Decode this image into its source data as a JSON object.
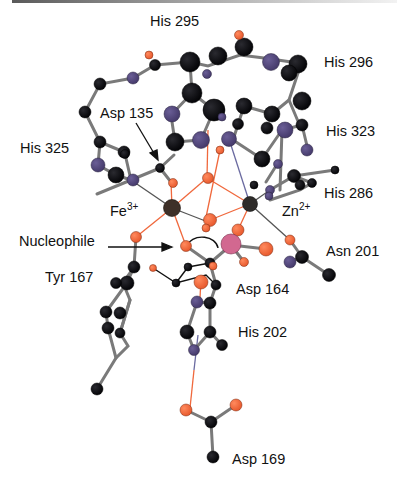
{
  "figure": {
    "metals": [
      {
        "id": "fe",
        "symbol": "Fe",
        "charge": "3+"
      },
      {
        "id": "zn",
        "symbol": "Zn",
        "charge": "2+"
      }
    ],
    "labels": {
      "his295": "His 295",
      "his296": "His 296",
      "asp135": "Asp 135",
      "his323": "His 323",
      "his325": "His 325",
      "his286": "His 286",
      "fe_symbol": "Fe",
      "fe_charge": "3+",
      "zn_symbol": "Zn",
      "zn_charge": "2+",
      "nucleophile": "Nucleophile",
      "asn201": "Asn 201",
      "tyr167": "Tyr 167",
      "asp164": "Asp 164",
      "his202": "His 202",
      "asp169": "Asp 169"
    },
    "colors": {
      "carbon": "#0d0d12",
      "nitrogen": "#54487e",
      "oxygen": "#f0683c",
      "phosphorus": "#d0608c",
      "iron": "#3a2e26",
      "zinc": "#2e2c2a",
      "bond": "#8a8a8a",
      "coord_bond_o": "#f0683c",
      "coord_bond_n": "#6a6aa0"
    }
  }
}
